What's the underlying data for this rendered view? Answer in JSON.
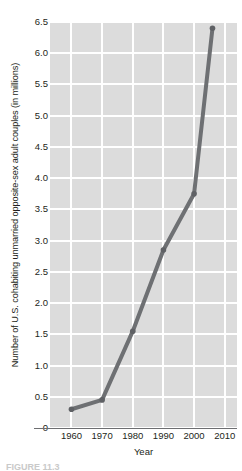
{
  "chart_data": {
    "type": "line",
    "title": "",
    "xlabel": "Year",
    "ylabel": "Number of U.S. cohabiting unmarried opposite-sex adult couples (in millions)",
    "x": [
      1960,
      1970,
      1980,
      1990,
      2000,
      2006
    ],
    "values": [
      0.3,
      0.45,
      1.55,
      2.85,
      3.75,
      6.4
    ],
    "series": [
      {
        "name": "U.S. cohabiting unmarried opposite-sex adult couples",
        "values": [
          0.3,
          0.45,
          1.55,
          2.85,
          3.75,
          6.4
        ]
      }
    ],
    "xlim": [
      1953,
      2014
    ],
    "ylim": [
      0,
      6.5
    ],
    "xticks": [
      1960,
      1970,
      1980,
      1990,
      2000,
      2010
    ],
    "xtick_labels": [
      "1960",
      "1970",
      "1980",
      "1990",
      "2000",
      "2010"
    ],
    "yticks": [
      0,
      0.5,
      1.0,
      1.5,
      2.0,
      2.5,
      3.0,
      3.5,
      4.0,
      4.5,
      5.0,
      5.5,
      6.0,
      6.5
    ],
    "ytick_labels": [
      "0",
      "0.5",
      "1.0",
      "1.5",
      "2.0",
      "2.5",
      "3.0",
      "3.5",
      "4.0",
      "4.5",
      "5.0",
      "5.5",
      "6.0",
      "6.5"
    ],
    "grid": true,
    "legend": "none",
    "colors": {
      "plot_background": "#dcdcdc",
      "gridline": "#ffffff",
      "series_line": "#6e7073",
      "marker": "#5f6165",
      "axis": "#6d6e71",
      "text": "#231f20"
    },
    "marker_style": "circle",
    "line_width_px": 4
  },
  "caption": {
    "text": "FIGURE 11.3"
  }
}
